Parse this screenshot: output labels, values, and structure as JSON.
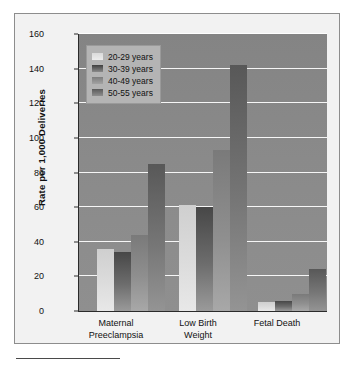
{
  "chart_data": {
    "type": "bar",
    "title": "",
    "xlabel": "",
    "ylabel": "Rate per 1,000 Deliveries",
    "ylim": [
      0,
      160
    ],
    "ytick_labels": [
      "0",
      "20",
      "40",
      "60",
      "80",
      "100",
      "120",
      "140",
      "160"
    ],
    "ytick_values": [
      0,
      20,
      40,
      60,
      80,
      100,
      120,
      140,
      160
    ],
    "grid": true,
    "legend_position": "upper-left",
    "categories": [
      "Maternal Preeclampsia",
      "Low Birth Weight",
      "Fetal Death"
    ],
    "category_lines": [
      [
        "Maternal",
        "Preeclampsia"
      ],
      [
        "Low Birth",
        "Weight"
      ],
      [
        "Fetal Death",
        ""
      ]
    ],
    "series": [
      {
        "name": "20-29 years",
        "values": [
          36,
          61,
          5
        ],
        "color": "#dcdcdc"
      },
      {
        "name": "30-39 years",
        "values": [
          34,
          60,
          6
        ],
        "color": "#6d6d6d"
      },
      {
        "name": "40-49 years",
        "values": [
          44,
          93,
          10
        ],
        "color": "#8f8f8f"
      },
      {
        "name": "50-55 years",
        "values": [
          85,
          142,
          24
        ],
        "color": "#767676"
      }
    ]
  },
  "legend": {
    "items": [
      {
        "label": "20-29 years"
      },
      {
        "label": "30-39 years"
      },
      {
        "label": "40-49 years"
      },
      {
        "label": "50-55 years"
      }
    ]
  },
  "colors": {
    "plot_background": "#8a8a8a",
    "gridline": "#ffffff",
    "axis": "#2b2b2b",
    "figure_background": "#f2f2f2",
    "page_background": "#ffffff"
  }
}
